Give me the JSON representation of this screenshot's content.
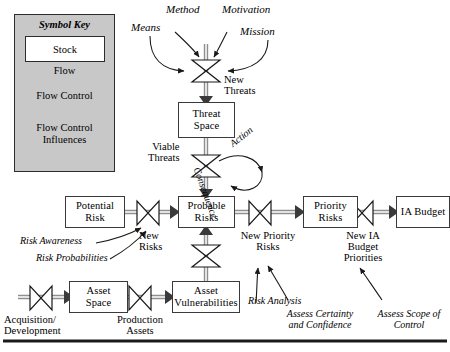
{
  "diagram": {
    "background_color": "#ffffff",
    "legend_fill": "#c8c8c8",
    "pipe_color": "#8c8c8c",
    "line_color": "#1a1a1a"
  },
  "legend": {
    "title": "Symbol Key",
    "stock_label": "Stock",
    "flow_label": "Flow",
    "flow_control_label": "Flow Control",
    "influences_label_line1": "Flow Control",
    "influences_label_line2": "Influences"
  },
  "stocks": [
    {
      "id": "threat-space",
      "line1": "Threat",
      "line2": "Space"
    },
    {
      "id": "potential-risk",
      "line1": "Potential",
      "line2": "Risk"
    },
    {
      "id": "probable-risks",
      "line1": "Probable",
      "line2": "Risks"
    },
    {
      "id": "priority-risks",
      "line1": "Priority",
      "line2": "Risks"
    },
    {
      "id": "ia-budget",
      "line1": "IA Budget",
      "line2": ""
    },
    {
      "id": "asset-space",
      "line1": "Asset",
      "line2": "Space"
    },
    {
      "id": "asset-vulnerabilities",
      "line1": "Asset",
      "line2": "Vulnerabilities"
    }
  ],
  "influences": [
    {
      "id": "method",
      "label": "Method"
    },
    {
      "id": "motivation",
      "label": "Motivation"
    },
    {
      "id": "means",
      "label": "Means"
    },
    {
      "id": "mission",
      "label": "Mission"
    },
    {
      "id": "risk-awareness",
      "label": "Risk Awareness"
    },
    {
      "id": "risk-probabilities",
      "label": "Risk Probabilities"
    },
    {
      "id": "risk-analysis",
      "label": "Risk Analysis"
    },
    {
      "id": "assess-certainty",
      "line1": "Assess Certainty",
      "line2": "and Confidence"
    },
    {
      "id": "assess-scope",
      "line1": "Assess Scope of",
      "line2": "Control"
    },
    {
      "id": "action",
      "label": "Action"
    },
    {
      "id": "consequence",
      "label": "Consequence"
    }
  ],
  "flow_labels": [
    {
      "id": "new-threats",
      "line1": "New",
      "line2": "Threats"
    },
    {
      "id": "viable-threats",
      "line1": "Viable",
      "line2": "Threats"
    },
    {
      "id": "new-risks",
      "line1": "New",
      "line2": "Risks"
    },
    {
      "id": "new-priority-risks",
      "line1": "New Priority",
      "line2": "Risks"
    },
    {
      "id": "new-ia-budget-priorities",
      "line1": "New IA",
      "line2": "Budget",
      "line3": "Priorities"
    },
    {
      "id": "acquisition-development",
      "line1": "Acquisition/",
      "line2": "Development"
    },
    {
      "id": "production-assets",
      "line1": "Production",
      "line2": "Assets"
    }
  ]
}
